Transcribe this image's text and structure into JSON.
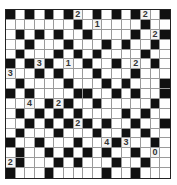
{
  "puzzle": {
    "rows": 17,
    "cols": 17,
    "legend": {
      "B": "black",
      "W": "white",
      "digit": "numbered clue"
    },
    "grid": [
      [
        "B",
        "W",
        "B",
        "W",
        "B",
        "W",
        "B",
        "2",
        "W",
        "B",
        "W",
        "B",
        "W",
        "B",
        "2",
        "W",
        "B"
      ],
      [
        "W",
        "W",
        "W",
        "W",
        "W",
        "W",
        "W",
        "B",
        "W",
        "1",
        "W",
        "W",
        "W",
        "W",
        "B",
        "W",
        "W"
      ],
      [
        "W",
        "B",
        "W",
        "B",
        "W",
        "B",
        "W",
        "W",
        "B",
        "W",
        "W",
        "W",
        "W",
        "B",
        "W",
        "2",
        "B"
      ],
      [
        "W",
        "W",
        "B",
        "W",
        "W",
        "W",
        "B",
        "W",
        "W",
        "W",
        "B",
        "W",
        "B",
        "W",
        "W",
        "B",
        "W"
      ],
      [
        "W",
        "B",
        "W",
        "W",
        "W",
        "B",
        "W",
        "B",
        "W",
        "B",
        "W",
        "W",
        "W",
        "W",
        "B",
        "W",
        "W"
      ],
      [
        "B",
        "W",
        "B",
        "3",
        "B",
        "W",
        "1",
        "W",
        "B",
        "W",
        "W",
        "B",
        "W",
        "2",
        "W",
        "B",
        "W"
      ],
      [
        "3",
        "W",
        "W",
        "B",
        "W",
        "B",
        "W",
        "W",
        "W",
        "B",
        "W",
        "W",
        "W",
        "B",
        "W",
        "W",
        "W"
      ],
      [
        "W",
        "B",
        "W",
        "W",
        "W",
        "W",
        "B",
        "W",
        "W",
        "W",
        "B",
        "W",
        "B",
        "W",
        "W",
        "W",
        "B"
      ],
      [
        "B",
        "W",
        "B",
        "W",
        "W",
        "W",
        "W",
        "B",
        "B",
        "W",
        "W",
        "B",
        "W",
        "B",
        "W",
        "W",
        "B"
      ],
      [
        "W",
        "W",
        "4",
        "W",
        "B",
        "2",
        "B",
        "W",
        "W",
        "B",
        "W",
        "W",
        "W",
        "W",
        "W",
        "B",
        "W"
      ],
      [
        "W",
        "B",
        "W",
        "B",
        "W",
        "B",
        "W",
        "B",
        "W",
        "W",
        "W",
        "W",
        "B",
        "W",
        "B",
        "W",
        "W"
      ],
      [
        "W",
        "W",
        "B",
        "W",
        "B",
        "W",
        "B",
        "2",
        "B",
        "W",
        "B",
        "W",
        "W",
        "B",
        "W",
        "W",
        "B"
      ],
      [
        "W",
        "B",
        "W",
        "W",
        "W",
        "B",
        "W",
        "W",
        "W",
        "B",
        "W",
        "W",
        "B",
        "W",
        "B",
        "W",
        "W"
      ],
      [
        "B",
        "W",
        "W",
        "B",
        "W",
        "W",
        "W",
        "B",
        "W",
        "W",
        "4",
        "B",
        "3",
        "W",
        "W",
        "B",
        "W"
      ],
      [
        "W",
        "B",
        "W",
        "W",
        "B",
        "W",
        "B",
        "W",
        "B",
        "W",
        "B",
        "W",
        "W",
        "B",
        "W",
        "0",
        "W"
      ],
      [
        "2",
        "B",
        "W",
        "W",
        "W",
        "B",
        "W",
        "B",
        "W",
        "W",
        "W",
        "B",
        "W",
        "W",
        "B",
        "W",
        "W"
      ],
      [
        "B",
        "W",
        "W",
        "W",
        "B",
        "W",
        "W",
        "W",
        "W",
        "W",
        "B",
        "W",
        "W",
        "B",
        "W",
        "W",
        "W"
      ]
    ]
  },
  "colors": {
    "black_cell": "#111111",
    "white_cell": "#ffffff",
    "grid_line": "#9a9a9a",
    "number_text": "#333333"
  }
}
